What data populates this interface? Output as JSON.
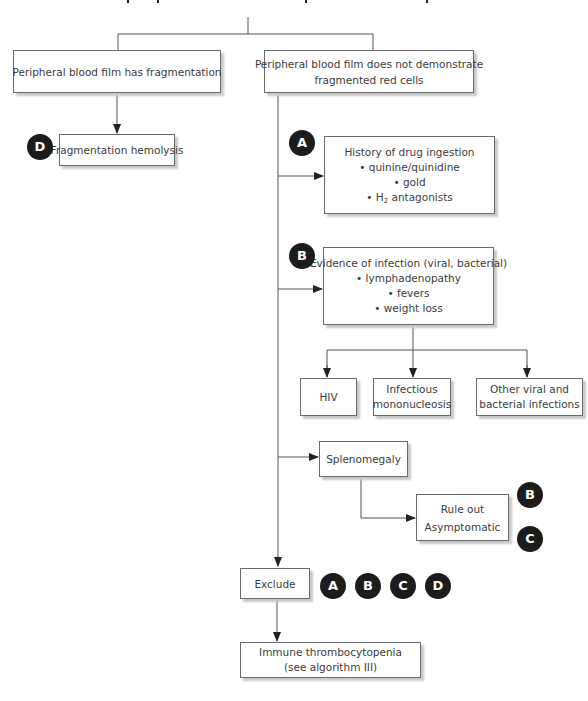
{
  "diagram": {
    "nodes": {
      "fragmentation_yes": {
        "lines": [
          "Peripheral blood film has fragmentation"
        ]
      },
      "fragmentation_no": {
        "lines": [
          "Peripheral blood film does not demonstrate",
          "fragmented red cells"
        ]
      },
      "fragmentation_hemolysis": {
        "lines": [
          "Fragmentation hemolysis"
        ]
      },
      "drug_history": {
        "title": "History of drug ingestion",
        "bullets": [
          "quinine/quinidine",
          "gold"
        ],
        "h2_prefix": "H",
        "h2_sub": "2",
        "h2_suffix": " antagonists"
      },
      "infection": {
        "title": "Evidence of infection (viral, bacterial)",
        "bullets": [
          "lymphadenopathy",
          "fevers",
          "weight loss"
        ]
      },
      "hiv": {
        "lines": [
          "HIV"
        ]
      },
      "mono": {
        "lines": [
          "Infectious",
          "mononucleosis"
        ]
      },
      "other_infections": {
        "lines": [
          "Other viral and",
          "bacterial infections"
        ]
      },
      "splenomegaly": {
        "lines": [
          "Splenomegaly"
        ]
      },
      "rule_out": {
        "lines": [
          "Rule out",
          "Asymptomatic"
        ]
      },
      "exclude": {
        "lines": [
          "Exclude"
        ]
      },
      "itp": {
        "lines": [
          "Immune thrombocytopenia",
          "(see algorithm III)"
        ]
      }
    },
    "bullet_char": "•",
    "badges": {
      "d_fragmentation": "D",
      "a_drug": "A",
      "b_infection": "B",
      "b_rule_out": "B",
      "c_rule_out": "C",
      "exclude_a": "A",
      "exclude_b": "B",
      "exclude_c": "C",
      "exclude_d": "D"
    },
    "colors": {
      "line": "#555555",
      "badge": "#1c1c1c",
      "box_border": "#6a6a6a",
      "shadow": "#c8c8c8"
    }
  }
}
